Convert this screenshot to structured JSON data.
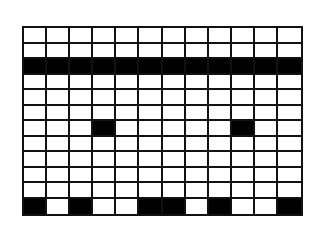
{
  "diagram": {
    "type": "weaving-pattern-grid",
    "columns": 12,
    "rows": 12,
    "colors": {
      "filled": "#000000",
      "empty": "#ffffff",
      "line": "#111111"
    },
    "grid": [
      [
        0,
        0,
        0,
        0,
        0,
        0,
        0,
        0,
        0,
        0,
        0,
        0
      ],
      [
        0,
        0,
        0,
        0,
        0,
        0,
        0,
        0,
        0,
        0,
        0,
        0
      ],
      [
        1,
        1,
        1,
        1,
        1,
        1,
        1,
        1,
        1,
        1,
        1,
        1
      ],
      [
        0,
        0,
        0,
        0,
        0,
        0,
        0,
        0,
        0,
        0,
        0,
        0
      ],
      [
        0,
        0,
        0,
        0,
        0,
        0,
        0,
        0,
        0,
        0,
        0,
        0
      ],
      [
        0,
        0,
        0,
        0,
        0,
        0,
        0,
        0,
        0,
        0,
        0,
        0
      ],
      [
        0,
        0,
        0,
        1,
        0,
        0,
        0,
        0,
        0,
        1,
        0,
        0
      ],
      [
        0,
        0,
        0,
        0,
        0,
        0,
        0,
        0,
        0,
        0,
        0,
        0
      ],
      [
        0,
        0,
        0,
        0,
        0,
        0,
        0,
        0,
        0,
        0,
        0,
        0
      ],
      [
        0,
        0,
        0,
        0,
        0,
        0,
        0,
        0,
        0,
        0,
        0,
        0
      ],
      [
        0,
        0,
        0,
        0,
        0,
        0,
        0,
        0,
        0,
        0,
        0,
        0
      ],
      [
        1,
        0,
        1,
        0,
        0,
        1,
        1,
        0,
        1,
        0,
        0,
        1
      ]
    ]
  }
}
